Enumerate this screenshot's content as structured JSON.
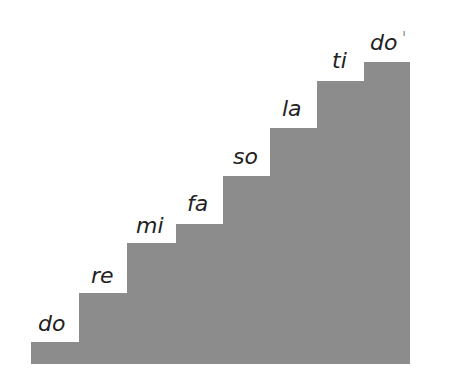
{
  "diagram": {
    "fill_color": "#8c8c8c",
    "baseline_y": 364,
    "steps": [
      {
        "label": "do",
        "left": 31,
        "right": 79,
        "top": 342,
        "label_x": 38,
        "label_y": 313
      },
      {
        "label": "re",
        "left": 79,
        "right": 127,
        "top": 293,
        "label_x": 91,
        "label_y": 265
      },
      {
        "label": "mi",
        "left": 127,
        "right": 176,
        "top": 243,
        "label_x": 136,
        "label_y": 215
      },
      {
        "label": "fa",
        "left": 176,
        "right": 223,
        "top": 224,
        "label_x": 187,
        "label_y": 193
      },
      {
        "label": "so",
        "left": 223,
        "right": 270,
        "top": 176,
        "label_x": 233,
        "label_y": 146
      },
      {
        "label": "la",
        "left": 270,
        "right": 317,
        "top": 128,
        "label_x": 282,
        "label_y": 98
      },
      {
        "label": "ti",
        "left": 317,
        "right": 364,
        "top": 81,
        "label_x": 332,
        "label_y": 50
      },
      {
        "label": "do",
        "left": 364,
        "right": 410,
        "top": 62,
        "label_x": 370,
        "label_y": 32,
        "prime": "ˡ"
      }
    ]
  }
}
